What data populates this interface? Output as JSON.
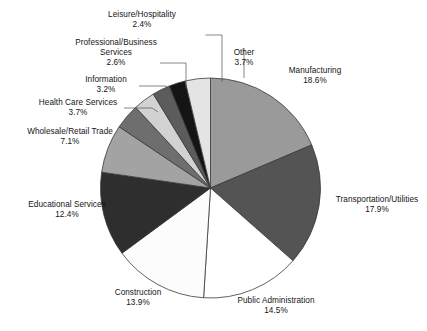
{
  "chart_data": {
    "type": "pie",
    "title": "",
    "subtitle": "",
    "xlabel": "",
    "ylabel": "",
    "legend_position": "none",
    "grid": false,
    "value_unit": "%",
    "start_angle_deg": -90,
    "direction": "clockwise",
    "categories": [
      "Manufacturing",
      "Transportation/Utilities",
      "Public Administration",
      "Construction",
      "Educational Services",
      "Wholesale/Retail Trade",
      "Health Care Services",
      "Information",
      "Professional/Business Services",
      "Leisure/Hospitality",
      "Other"
    ],
    "values": [
      18.6,
      17.9,
      14.5,
      13.9,
      12.4,
      7.1,
      3.7,
      3.2,
      2.6,
      2.4,
      3.7
    ],
    "value_labels": [
      "18.6%",
      "17.9%",
      "14.5%",
      "13.9%",
      "12.4%",
      "7.1%",
      "3.7%",
      "3.2%",
      "2.6%",
      "2.4%",
      "3.7%"
    ],
    "colors": [
      "#9a9a9a",
      "#545454",
      "#ffffff",
      "#fcfcfc",
      "#2e2e2e",
      "#a3a3a3",
      "#6e6e6e",
      "#d2d2d2",
      "#5c5c5c",
      "#141414",
      "#e4e4e4"
    ],
    "slices": [
      {
        "label": "Manufacturing",
        "value": 18.6,
        "value_label": "18.6%",
        "color": "#9a9a9a"
      },
      {
        "label": "Transportation/Utilities",
        "value": 17.9,
        "value_label": "17.9%",
        "color": "#545454"
      },
      {
        "label": "Public Administration",
        "value": 14.5,
        "value_label": "14.5%",
        "color": "#ffffff"
      },
      {
        "label": "Construction",
        "value": 13.9,
        "value_label": "13.9%",
        "color": "#fcfcfc"
      },
      {
        "label": "Educational Services",
        "value": 12.4,
        "value_label": "12.4%",
        "color": "#2e2e2e"
      },
      {
        "label": "Wholesale/Retail Trade",
        "value": 7.1,
        "value_label": "7.1%",
        "color": "#a3a3a3"
      },
      {
        "label": "Health Care Services",
        "value": 3.7,
        "value_label": "3.7%",
        "color": "#6e6e6e"
      },
      {
        "label": "Information",
        "value": 3.2,
        "value_label": "3.2%",
        "color": "#d2d2d2"
      },
      {
        "label": "Professional/Business Services",
        "value": 2.6,
        "value_label": "2.6%",
        "color": "#5c5c5c"
      },
      {
        "label": "Leisure/Hospitality",
        "value": 2.4,
        "value_label": "2.4%",
        "color": "#141414"
      },
      {
        "label": "Other",
        "value": 3.7,
        "value_label": "3.7%",
        "color": "#e4e4e4"
      }
    ]
  },
  "labels": {
    "manufacturing": {
      "name": "Manufacturing",
      "pct": "18.6%"
    },
    "transportation": {
      "name": "Transportation/Utilities",
      "pct": "17.9%"
    },
    "public_admin": {
      "name": "Public Administration",
      "pct": "14.5%"
    },
    "construction": {
      "name": "Construction",
      "pct": "13.9%"
    },
    "educational": {
      "name": "Educational Services",
      "pct": "12.4%"
    },
    "wholesale": {
      "name": "Wholesale/Retail Trade",
      "pct": "7.1%"
    },
    "healthcare": {
      "name": "Health Care Services",
      "pct": "3.7%"
    },
    "information": {
      "name": "Information",
      "pct": "3.2%"
    },
    "professional": {
      "name1": "Professional/Business",
      "name2": "Services",
      "pct": "2.6%"
    },
    "leisure": {
      "name": "Leisure/Hospitality",
      "pct": "2.4%"
    },
    "other": {
      "name": "Other",
      "pct": "3.7%"
    }
  }
}
